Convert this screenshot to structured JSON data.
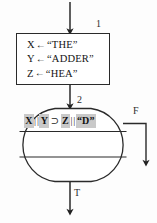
{
  "diagram": {
    "background_color": "#fdfdfd",
    "stroke_color": "#2a2a2a",
    "highlight_color": "#c9c9c9"
  },
  "process_node": {
    "step_label": "1",
    "lines": [
      {
        "variable": "X",
        "operator": "←",
        "value": "“THE”"
      },
      {
        "variable": "Y",
        "operator": "←",
        "value": "“ADDER”"
      },
      {
        "variable": "Z",
        "operator": "←",
        "value": "“HEA”"
      }
    ]
  },
  "decision_node": {
    "step_label": "2",
    "condition_tokens": [
      {
        "text": "X",
        "highlight": true
      },
      {
        "text": "|",
        "highlight": false
      },
      {
        "text": "|",
        "highlight": false
      },
      {
        "text": "Y",
        "highlight": true
      },
      {
        "text": "⊃",
        "highlight": false
      },
      {
        "text": "Z",
        "highlight": true
      },
      {
        "text": "|",
        "highlight": false
      },
      {
        "text": "|",
        "highlight": false
      },
      {
        "text": "“D”",
        "highlight": true
      }
    ]
  },
  "branches": {
    "false_label": "F",
    "true_label": "T"
  },
  "caption": {
    "text": ""
  }
}
